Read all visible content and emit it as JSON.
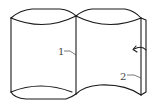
{
  "diagram": {
    "labels": [
      {
        "id": "1",
        "text": "1",
        "target": "central seam line"
      },
      {
        "id": "2",
        "text": "2",
        "target": "right edge strip"
      }
    ],
    "arrow": {
      "direction": "curved-left"
    },
    "colors": {
      "line": "#1a1a1a",
      "background": "#ffffff"
    }
  }
}
